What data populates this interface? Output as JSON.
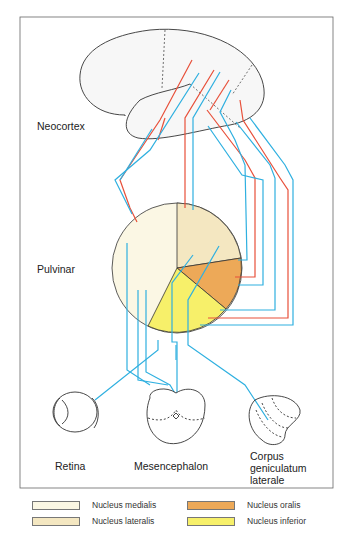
{
  "labels": {
    "neocortex": "Neocortex",
    "pulvinar": "Pulvinar",
    "retina": "Retina",
    "mesencephalon": "Mesencephalon",
    "cgl_line1": "Corpus",
    "cgl_line2": "geniculatum",
    "cgl_line3": "laterale"
  },
  "legend": [
    {
      "label": "Nucleus medialis",
      "color": "#fbf7e4"
    },
    {
      "label": "Nucleus lateralis",
      "color": "#f4e7c1"
    },
    {
      "label": "Nucleus oralis",
      "color": "#eda958"
    },
    {
      "label": "Nucleus inferior",
      "color": "#f7f06a"
    }
  ],
  "colors": {
    "afferent": "#2fb0e0",
    "efferent": "#e8503a",
    "outline": "#333333"
  }
}
